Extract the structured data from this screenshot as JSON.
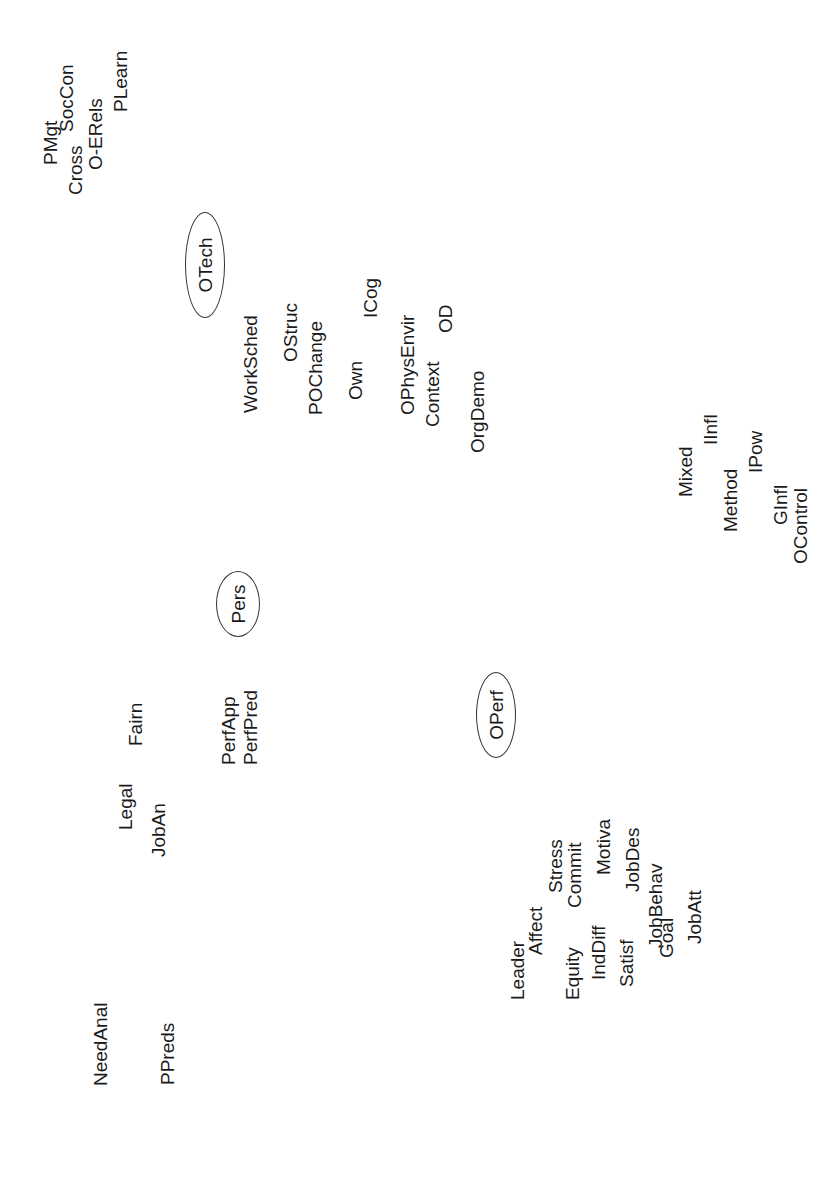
{
  "diagram": {
    "type": "concept-map",
    "orientation": "rotated -90deg (text reads bottom-to-top)",
    "clusters": [
      {
        "name": "OTech",
        "node": {
          "label": "OTech",
          "cx": 205,
          "cy": 265,
          "rx": 20,
          "ry": 53
        }
      },
      {
        "name": "Pers",
        "node": {
          "label": "Pers",
          "cx": 238,
          "cy": 604,
          "rx": 22,
          "ry": 33
        }
      },
      {
        "name": "OPerf",
        "node": {
          "label": "OPerf",
          "cx": 496,
          "cy": 715,
          "rx": 20,
          "ry": 43
        }
      }
    ],
    "labels": [
      {
        "text": "PMgt",
        "x": 50,
        "y": 165
      },
      {
        "text": "Cross",
        "x": 75,
        "y": 195
      },
      {
        "text": "SocCon",
        "x": 66,
        "y": 132
      },
      {
        "text": "O-ERels",
        "x": 95,
        "y": 170
      },
      {
        "text": "PLearn",
        "x": 120,
        "y": 112
      },
      {
        "text": "WorkSched",
        "x": 250,
        "y": 413
      },
      {
        "text": "OStruc",
        "x": 290,
        "y": 362
      },
      {
        "text": "POChange",
        "x": 315,
        "y": 415
      },
      {
        "text": "Own",
        "x": 355,
        "y": 400
      },
      {
        "text": "ICog",
        "x": 370,
        "y": 318
      },
      {
        "text": "OPhysEnvir",
        "x": 407,
        "y": 415
      },
      {
        "text": "Context",
        "x": 432,
        "y": 427
      },
      {
        "text": "OD",
        "x": 445,
        "y": 333
      },
      {
        "text": "OrgDemo",
        "x": 477,
        "y": 453
      },
      {
        "text": "Mixed",
        "x": 685,
        "y": 497
      },
      {
        "text": "IInfl",
        "x": 710,
        "y": 445
      },
      {
        "text": "Method",
        "x": 730,
        "y": 532
      },
      {
        "text": "IPow",
        "x": 755,
        "y": 473
      },
      {
        "text": "GInfl",
        "x": 780,
        "y": 525
      },
      {
        "text": "OControl",
        "x": 800,
        "y": 564
      },
      {
        "text": "Fairn",
        "x": 135,
        "y": 746
      },
      {
        "text": "PerfApp",
        "x": 228,
        "y": 765
      },
      {
        "text": "PerfPred",
        "x": 250,
        "y": 765
      },
      {
        "text": "Legal",
        "x": 125,
        "y": 830
      },
      {
        "text": "JobAn",
        "x": 158,
        "y": 857
      },
      {
        "text": "Leader",
        "x": 517,
        "y": 1000
      },
      {
        "text": "Affect",
        "x": 535,
        "y": 955
      },
      {
        "text": "Stress",
        "x": 555,
        "y": 893
      },
      {
        "text": "Equity",
        "x": 572,
        "y": 1000
      },
      {
        "text": "Commit",
        "x": 574,
        "y": 908
      },
      {
        "text": "Motiva",
        "x": 603,
        "y": 875
      },
      {
        "text": "IndDiff",
        "x": 598,
        "y": 980
      },
      {
        "text": "Satisf",
        "x": 626,
        "y": 987
      },
      {
        "text": "JobDes",
        "x": 632,
        "y": 892
      },
      {
        "text": "JobBehav",
        "x": 655,
        "y": 948
      },
      {
        "text": "Goal",
        "x": 666,
        "y": 958
      },
      {
        "text": "JobAtt",
        "x": 694,
        "y": 944
      },
      {
        "text": "NeedAnal",
        "x": 100,
        "y": 1086
      },
      {
        "text": "PPreds",
        "x": 167,
        "y": 1085
      }
    ]
  }
}
